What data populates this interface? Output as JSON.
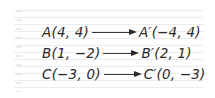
{
  "mappings": [
    {
      "original": "A(4, 4)",
      "image": "A′(−4, 4)",
      "arrow_icon": "right-arrow-icon"
    },
    {
      "original": "B(1, −2)",
      "image": "B′(2, 1)",
      "arrow_icon": "right-arrow-icon"
    },
    {
      "original": "C(−3, 0)",
      "image": "C′(0, −3)",
      "arrow_icon": "right-arrow-icon"
    }
  ],
  "colors": {
    "text": "#2a2a2a",
    "ruled_line": "#ececec",
    "background": "#ffffff"
  }
}
